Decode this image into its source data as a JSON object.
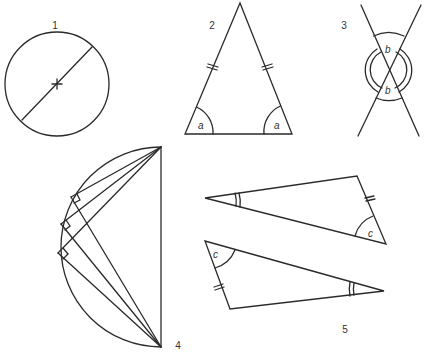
{
  "figures": [
    {
      "id": "1",
      "label": "1",
      "description": "Circle with diameter through center marked with cross"
    },
    {
      "id": "2",
      "label": "2",
      "description": "Isosceles triangle with equal sides marked and equal base angles",
      "angle_label": "a"
    },
    {
      "id": "3",
      "label": "3",
      "description": "Two intersecting lines with vertically opposite angles",
      "angle_label": "b"
    },
    {
      "id": "4",
      "label": "4",
      "description": "Semicircle with inscribed right angles on the arc (angle in a semicircle)"
    },
    {
      "id": "5",
      "label": "5",
      "description": "Two congruent triangles with matching side and angle marks",
      "angle_label": "c"
    }
  ],
  "labels": {
    "fig1": "1",
    "fig2": "2",
    "fig3": "3",
    "fig4": "4",
    "fig5": "5",
    "angle_a_left": "a",
    "angle_a_right": "a",
    "angle_b_top": "b",
    "angle_b_bottom": "b",
    "angle_c_top": "c",
    "angle_c_bottom": "c"
  },
  "colors": {
    "stroke": "#2a2a2a",
    "background": "#ffffff"
  }
}
